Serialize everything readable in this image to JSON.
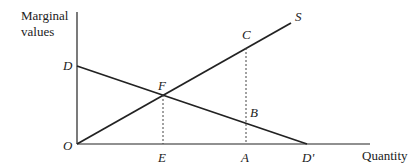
{
  "axes": {
    "y_label_line1": "Marginal",
    "y_label_line2": "values",
    "x_label": "Quantity"
  },
  "points": {
    "origin": "O",
    "demand_intercept": "D",
    "demand_end": "D'",
    "supply_label": "S",
    "intersection": "F",
    "equilibrium_qty": "E",
    "supply_at_A": "C",
    "demand_at_A": "B",
    "qty_A": "A"
  },
  "lines": [
    {
      "name": "demand",
      "from": "D",
      "to": "D'"
    },
    {
      "name": "supply",
      "from": "O",
      "to": "S"
    },
    {
      "name": "guide-F",
      "from": "F",
      "to": "E",
      "style": "dashed"
    },
    {
      "name": "guide-C",
      "from": "C",
      "to": "A",
      "style": "dashed"
    }
  ]
}
